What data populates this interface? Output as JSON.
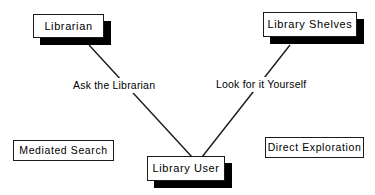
{
  "diagram": {
    "type": "node-link-diagram",
    "background_color": "#ffffff",
    "line_color": "#1a1a1a",
    "box_border_color": "#1a1a1a",
    "box_fill_color": "#ffffff",
    "shadow_color": "#000000",
    "nodes": [
      {
        "id": "librarian",
        "label": "Librarian",
        "shadow": true,
        "x": 33,
        "y": 14,
        "w": 71,
        "h": 24
      },
      {
        "id": "library-shelves",
        "label": "Library Shelves",
        "shadow": true,
        "x": 263,
        "y": 12,
        "w": 94,
        "h": 25
      },
      {
        "id": "library-user",
        "label": "Library User",
        "shadow": true,
        "x": 147,
        "y": 156,
        "w": 78,
        "h": 25
      },
      {
        "id": "mediated-search",
        "label": "Mediated Search",
        "shadow": false,
        "x": 13,
        "y": 140,
        "w": 101,
        "h": 21
      },
      {
        "id": "direct-exploration",
        "label": "Direct Exploration",
        "shadow": false,
        "x": 265,
        "y": 137,
        "w": 99,
        "h": 21
      }
    ],
    "edges": [
      {
        "id": "ask-the-librarian",
        "from": "librarian",
        "to": "library-user",
        "label": "Ask the Librarian",
        "x1": 89,
        "y1": 45,
        "x2": 192,
        "y2": 157
      },
      {
        "id": "look-for-it-yourself",
        "from": "library-shelves",
        "to": "library-user",
        "label": "Look for it Yourself",
        "x1": 290,
        "y1": 45,
        "x2": 202,
        "y2": 157
      }
    ]
  }
}
